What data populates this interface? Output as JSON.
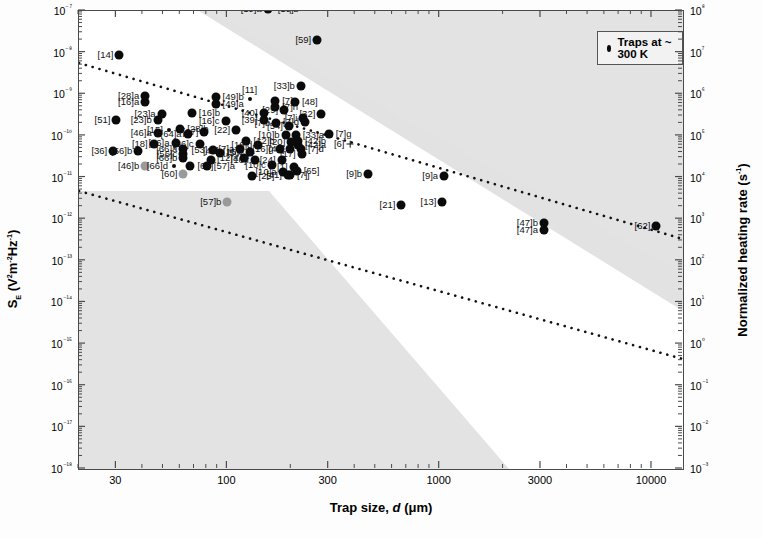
{
  "axes": {
    "x_title_prefix": "Trap size, ",
    "x_title_italic": "d",
    "x_title_suffix": " (μm)",
    "y_title": "Sₑ (V²m⁻²Hz⁻¹)",
    "y2_title": "Normalized heating rate (s⁻¹)"
  },
  "legend": {
    "marker": "filled-circle",
    "label": "Traps at ~ 300 K"
  },
  "chart_data": {
    "type": "scatter",
    "title": "",
    "xlabel": "Trap size, d (μm)",
    "ylabel": "S_E (V²m⁻²Hz⁻¹)",
    "y2label": "Normalized heating rate (s⁻¹)",
    "xscale": "log",
    "yscale": "log",
    "xlim": [
      20,
      14000
    ],
    "ylim": [
      1e-18,
      1e-07
    ],
    "y2lim": [
      0.001,
      100000000.0
    ],
    "xticks": [
      30,
      100,
      300,
      1000,
      3000,
      10000
    ],
    "xticklabels": [
      "30",
      "100",
      "300",
      "1000",
      "3000",
      "10000"
    ],
    "yticks": [
      1e-07,
      1e-08,
      1e-09,
      1e-10,
      1e-11,
      1e-12,
      1e-13,
      1e-14,
      1e-15,
      1e-16,
      1e-17,
      1e-18
    ],
    "yticklabels": [
      "10⁻⁷",
      "10⁻⁸",
      "10⁻⁹",
      "10⁻¹⁰",
      "10⁻¹¹",
      "10⁻¹²",
      "10⁻¹³",
      "10⁻¹⁴",
      "10⁻¹⁵",
      "10⁻¹⁶",
      "10⁻¹⁷",
      "10⁻¹⁸"
    ],
    "y2ticks": [
      100000000.0,
      10000000.0,
      1000000.0,
      100000.0,
      10000.0,
      1000.0,
      100.0,
      10.0,
      1.0,
      0.1,
      0.01,
      0.001
    ],
    "y2ticklabels": [
      "10⁸",
      "10⁷",
      "10⁶",
      "10⁵",
      "10⁴",
      "10³",
      "10²",
      "10¹",
      "10⁰",
      "10⁻¹",
      "10⁻²",
      "10⁻³"
    ],
    "grid": false,
    "legend_position": "top-right",
    "annotations": [
      {
        "type": "shaded-band",
        "name": "upper-gray-band",
        "note": "diagonal gray wedge spanning upper-right corner, slope matches d^-4 trend"
      },
      {
        "type": "shaded-band",
        "name": "lower-gray-band",
        "note": "diagonal gray wedge spanning lower-left corner"
      },
      {
        "type": "trendline",
        "name": "upper-dotted-line",
        "style": "dotted",
        "from": [
          25,
          4.5e-08
        ],
        "to": [
          14000,
          7e-12
        ]
      },
      {
        "type": "trendline",
        "name": "lower-dotted-line",
        "style": "dotted",
        "from": [
          25,
          1.1e-11
        ],
        "to": [
          14000,
          2.5e-15
        ]
      }
    ],
    "points": [
      {
        "label": "[19]a",
        "x": 155,
        "y": 1.1e-07,
        "lx": "left",
        "marker": "dot"
      },
      {
        "label": "[19]b",
        "x": 160,
        "y": 1.1e-07,
        "lx": "right",
        "marker": "none"
      },
      {
        "label": "[59]",
        "x": 265,
        "y": 2e-08,
        "lx": "left",
        "marker": "dot"
      },
      {
        "label": "[14]",
        "x": 31,
        "y": 9e-09,
        "lx": "left",
        "marker": "dot"
      },
      {
        "label": "[33]b",
        "x": 222,
        "y": 1.6e-09,
        "lx": "left",
        "marker": "dot"
      },
      {
        "label": "[28]a",
        "x": 41,
        "y": 9e-10,
        "lx": "left",
        "marker": "dot"
      },
      {
        "label": "[16]a",
        "x": 41,
        "y": 6.5e-10,
        "lx": "left",
        "marker": "dot"
      },
      {
        "label": "[49]b",
        "x": 88,
        "y": 8.5e-10,
        "lx": "right",
        "marker": "dot"
      },
      {
        "label": "[49]a",
        "x": 88,
        "y": 6e-10,
        "lx": "right",
        "marker": "dot"
      },
      {
        "label": "[11]",
        "x": 128,
        "y": 7.5e-10,
        "lx": "above",
        "marker": "tiny"
      },
      {
        "label": "[7]c",
        "x": 168,
        "y": 7e-10,
        "lx": "right",
        "marker": "dot"
      },
      {
        "label": "[7]h",
        "x": 168,
        "y": 5e-10,
        "lx": "right",
        "marker": "dot"
      },
      {
        "label": "[48]",
        "x": 208,
        "y": 6.5e-10,
        "lx": "right",
        "marker": "dot"
      },
      {
        "label": "[23]a",
        "x": 49,
        "y": 3.3e-10,
        "lx": "left",
        "marker": "dot"
      },
      {
        "label": "[16]b",
        "x": 68,
        "y": 3.6e-10,
        "lx": "right",
        "marker": "dot"
      },
      {
        "label": "[40]",
        "x": 148,
        "y": 3.6e-10,
        "lx": "left",
        "marker": "dot"
      },
      {
        "label": "[29]",
        "x": 185,
        "y": 4.2e-10,
        "lx": "left",
        "marker": "dot"
      },
      {
        "label": "[32]",
        "x": 277,
        "y": 3.4e-10,
        "lx": "left",
        "marker": "dot"
      },
      {
        "label": "[51]",
        "x": 30,
        "y": 2.4e-10,
        "lx": "left",
        "marker": "dot"
      },
      {
        "label": "[23]b",
        "x": 47,
        "y": 2.4e-10,
        "lx": "left",
        "marker": "dot"
      },
      {
        "label": "[39]",
        "x": 148,
        "y": 2.4e-10,
        "lx": "left",
        "marker": "dot"
      },
      {
        "label": "[16]c",
        "x": 98,
        "y": 2.3e-10,
        "lx": "left",
        "marker": "dot"
      },
      {
        "label": "[7]i",
        "x": 228,
        "y": 2.7e-10,
        "lx": "left",
        "marker": "dot"
      },
      {
        "label": "[7]d",
        "x": 232,
        "y": 2.1e-10,
        "lx": "left",
        "marker": "dot"
      },
      {
        "label": "[7]b",
        "x": 170,
        "y": 2e-10,
        "lx": "left",
        "marker": "dot"
      },
      {
        "label": "[54]",
        "x": 195,
        "y": 1.7e-10,
        "lx": "left",
        "marker": "dot"
      },
      {
        "label": "[15]",
        "x": 53,
        "y": 1.4e-10,
        "lx": "left",
        "marker": "tiny"
      },
      {
        "label": "[28]b",
        "x": 60,
        "y": 1.5e-10,
        "lx": "right",
        "marker": "dot"
      },
      {
        "label": "[46]a",
        "x": 47,
        "y": 1.2e-10,
        "lx": "left",
        "marker": "dot"
      },
      {
        "label": "[22]",
        "x": 110,
        "y": 1.4e-10,
        "lx": "left",
        "marker": "dot"
      },
      {
        "label": "[27]",
        "x": 78,
        "y": 1.25e-10,
        "lx": "left",
        "marker": "dot"
      },
      {
        "label": "[64]a",
        "x": 65,
        "y": 1.1e-10,
        "lx": "left",
        "marker": "dot"
      },
      {
        "label": "[10]b",
        "x": 188,
        "y": 1.05e-10,
        "lx": "left",
        "marker": "dot"
      },
      {
        "label": "[33]a",
        "x": 210,
        "y": 1.05e-10,
        "lx": "right",
        "marker": "dot"
      },
      {
        "label": "[7]g",
        "x": 300,
        "y": 1.1e-10,
        "lx": "right",
        "marker": "dot"
      },
      {
        "label": "[12]b",
        "x": 123,
        "y": 7.5e-11,
        "lx": "right",
        "marker": "dot"
      },
      {
        "label": "[18]",
        "x": 45,
        "y": 6.5e-11,
        "lx": "left",
        "marker": "dot"
      },
      {
        "label": "[56]a",
        "x": 57,
        "y": 6.8e-11,
        "lx": "left",
        "marker": "dot"
      },
      {
        "label": "[66]c",
        "x": 74,
        "y": 6.5e-11,
        "lx": "left",
        "marker": "dot"
      },
      {
        "label": "[20]",
        "x": 200,
        "y": 7e-11,
        "lx": "left",
        "marker": "dot"
      },
      {
        "label": "[42]b",
        "x": 215,
        "y": 7.6e-11,
        "lx": "right",
        "marker": "dot"
      },
      {
        "label": "[42]a",
        "x": 215,
        "y": 6e-11,
        "lx": "right",
        "marker": "dot"
      },
      {
        "label": "[16]d",
        "x": 140,
        "y": 6.2e-11,
        "lx": "left",
        "marker": "dot"
      },
      {
        "label": "[6]",
        "x": 380,
        "y": 6.5e-11,
        "lx": "left",
        "marker": "cross"
      },
      {
        "label": "[7]a",
        "x": 115,
        "y": 4.8e-11,
        "lx": "left",
        "marker": "dot"
      },
      {
        "label": "[36]",
        "x": 29,
        "y": 4.3e-11,
        "lx": "left",
        "marker": "dot"
      },
      {
        "label": "[56]b",
        "x": 38,
        "y": 4.3e-11,
        "lx": "left",
        "marker": "dot"
      },
      {
        "label": "[66]a",
        "x": 62,
        "y": 4.8e-11,
        "lx": "left",
        "marker": "dot"
      },
      {
        "label": "[53]",
        "x": 86,
        "y": 4.6e-11,
        "lx": "left",
        "marker": "dot"
      },
      {
        "label": "[16]g",
        "x": 176,
        "y": 4.8e-11,
        "lx": "left",
        "marker": "dot"
      },
      {
        "label": "[45]",
        "x": 198,
        "y": 4.9e-11,
        "lx": "left",
        "marker": "dot"
      },
      {
        "label": "[7]d2",
        "x": 222,
        "y": 4.8e-11,
        "lx": "right",
        "marker": "dot"
      },
      {
        "label": "[16]e",
        "x": 128,
        "y": 4e-11,
        "lx": "left",
        "marker": "dot"
      },
      {
        "label": "[56]c",
        "x": 62,
        "y": 3.7e-11,
        "lx": "left",
        "marker": "dot"
      },
      {
        "label": "[50]",
        "x": 92,
        "y": 3.8e-11,
        "lx": "right",
        "marker": "dot"
      },
      {
        "label": "[17]",
        "x": 224,
        "y": 3.6e-11,
        "lx": "left",
        "marker": "dot"
      },
      {
        "label": "[12]a",
        "x": 120,
        "y": 3e-11,
        "lx": "left",
        "marker": "dot"
      },
      {
        "label": "[66]b",
        "x": 62,
        "y": 2.9e-11,
        "lx": "left",
        "marker": "dot"
      },
      {
        "label": "[44]",
        "x": 84,
        "y": 2.7e-11,
        "lx": "above",
        "marker": "dot"
      },
      {
        "label": "[16]f",
        "x": 135,
        "y": 2.6e-11,
        "lx": "left",
        "marker": "dot"
      },
      {
        "label": "[24]",
        "x": 180,
        "y": 2.6e-11,
        "lx": "left",
        "marker": "dot"
      },
      {
        "label": "[46]b",
        "x": 41,
        "y": 1.9e-11,
        "lx": "left",
        "marker": "graydot"
      },
      {
        "label": "[66]d",
        "x": 56,
        "y": 1.9e-11,
        "lx": "left",
        "marker": "tiny"
      },
      {
        "label": "[63]",
        "x": 67,
        "y": 1.9e-11,
        "lx": "right",
        "marker": "dot"
      },
      {
        "label": "[57]a",
        "x": 80,
        "y": 1.9e-11,
        "lx": "right",
        "marker": "dot"
      },
      {
        "label": "[10]c",
        "x": 162,
        "y": 2e-11,
        "lx": "left",
        "marker": "dot"
      },
      {
        "label": "[1]",
        "x": 205,
        "y": 1.8e-11,
        "lx": "left",
        "marker": "dot"
      },
      {
        "label": "[60]",
        "x": 62,
        "y": 1.2e-11,
        "lx": "left",
        "marker": "graydot"
      },
      {
        "label": "[10]a",
        "x": 182,
        "y": 1.35e-11,
        "lx": "left",
        "marker": "dot"
      },
      {
        "label": "[65]",
        "x": 212,
        "y": 1.4e-11,
        "lx": "right",
        "marker": "dot"
      },
      {
        "label": "[41]",
        "x": 193,
        "y": 1.15e-11,
        "lx": "left",
        "marker": "dot"
      },
      {
        "label": "[7]j",
        "x": 197,
        "y": 1.15e-11,
        "lx": "right",
        "marker": "dot"
      },
      {
        "label": "[25]",
        "x": 130,
        "y": 1.1e-11,
        "lx": "right",
        "marker": "dot"
      },
      {
        "label": "[9]b",
        "x": 460,
        "y": 1.2e-11,
        "lx": "left",
        "marker": "dot"
      },
      {
        "label": "[9]a",
        "x": 1050,
        "y": 1.1e-11,
        "lx": "left",
        "marker": "dot"
      },
      {
        "label": "[57]b",
        "x": 100,
        "y": 2.6e-12,
        "lx": "left",
        "marker": "graydot"
      },
      {
        "label": "[21]",
        "x": 660,
        "y": 2.2e-12,
        "lx": "left",
        "marker": "dot"
      },
      {
        "label": "[13]",
        "x": 1030,
        "y": 2.6e-12,
        "lx": "left",
        "marker": "dot"
      },
      {
        "label": "[47]b",
        "x": 3100,
        "y": 8e-13,
        "lx": "left",
        "marker": "dot"
      },
      {
        "label": "[47]a",
        "x": 3100,
        "y": 5.5e-13,
        "lx": "left",
        "marker": "dot"
      },
      {
        "label": "[62]",
        "x": 10500,
        "y": 7e-13,
        "lx": "left",
        "marker": "dot"
      }
    ]
  }
}
